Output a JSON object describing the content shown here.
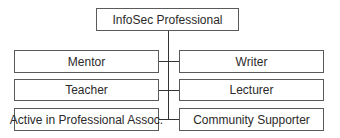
{
  "diagram": {
    "root": {
      "label": "InfoSec Professional"
    },
    "left": [
      {
        "label": "Mentor"
      },
      {
        "label": "Teacher"
      },
      {
        "label": "Active in Professional Assoc."
      }
    ],
    "right": [
      {
        "label": "Writer"
      },
      {
        "label": "Lecturer"
      },
      {
        "label": "Community Supporter"
      }
    ],
    "colors": {
      "border": "#5a5a5a",
      "line": "#333333",
      "text": "#2a2a2a",
      "background": "#ffffff"
    }
  }
}
